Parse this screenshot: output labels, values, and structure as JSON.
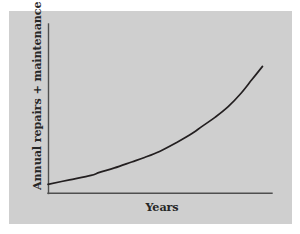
{
  "figure": {
    "panel_background": "#cfcfcf",
    "page_background": "#ffffff",
    "axis_color": "#4f4f4f",
    "curve_color": "#231f20",
    "label_color": "#262626"
  },
  "labels": {
    "y_axis_main": "Annual repairs + maintenance (",
    "y_axis_currency": "£",
    "y_axis_close": ")",
    "y_axis_full": "Annual repairs + maintenance (£)",
    "x_axis": "Years"
  },
  "chart_data": {
    "type": "line",
    "title": "",
    "subtitle": "",
    "xlabel": "Years",
    "ylabel": "Annual repairs + maintenance (£)",
    "grid": false,
    "legend": "none",
    "axis_ticks": "none",
    "tick_labels": [],
    "xlim": [
      0,
      100
    ],
    "ylim": [
      0,
      100
    ],
    "annotations": [],
    "series": [
      {
        "name": "Annual repairs + maintenance",
        "x": [
          0,
          10,
          20,
          24,
          31,
          39,
          45,
          52,
          60,
          66,
          72,
          78,
          84,
          90,
          95,
          100
        ],
        "y": [
          6,
          9,
          12,
          14,
          17,
          21,
          24,
          28,
          34,
          39,
          45,
          51,
          58,
          67,
          76,
          85
        ]
      }
    ]
  }
}
